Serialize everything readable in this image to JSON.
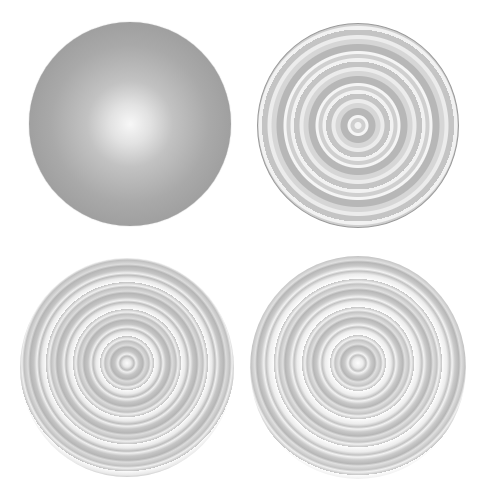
{
  "figure": {
    "panels": [
      {
        "position": "top-left",
        "style": "smooth radial gradient",
        "center_color": "#f7f7f7",
        "edge_color": "#959595"
      },
      {
        "position": "top-right",
        "style": "concentric rings, outlined",
        "ring_colors": [
          "#f2f2f2",
          "#cfcfcf",
          "#b7b7b7",
          "#d6d6d6"
        ]
      },
      {
        "position": "bottom-left",
        "style": "concentric swirling rings",
        "ring_colors": [
          "#fbfbfb",
          "#bdbdbd",
          "#c6c6c6",
          "#b5b5b5"
        ]
      },
      {
        "position": "bottom-right",
        "style": "concentric swirling rings",
        "ring_colors": [
          "#fdfdfd",
          "#c2c2c2",
          "#cbcbcb",
          "#b6b6b6"
        ]
      }
    ]
  }
}
